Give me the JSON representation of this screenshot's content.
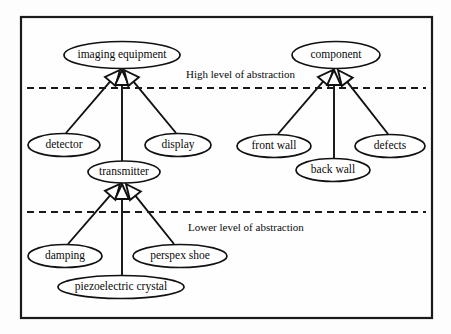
{
  "diagram": {
    "type": "uml-generalization-hierarchy",
    "canvas": {
      "width": 451,
      "height": 334
    },
    "frame": {
      "x": 21,
      "y": 17,
      "width": 411,
      "height": 301,
      "stroke": "#1a1a1a"
    },
    "style": {
      "node_fill": "#ffffff",
      "node_stroke": "#111111",
      "line_color": "#111111",
      "text_color": "#0a0a0a",
      "background": "#fdfdfd"
    },
    "nodes": [
      {
        "id": "imaging-equipment",
        "label": "imaging equipment",
        "cx": 122,
        "cy": 55,
        "rx": 58,
        "ry": 13.5,
        "font_size": 11.5
      },
      {
        "id": "component",
        "label": "component",
        "cx": 336,
        "cy": 55,
        "rx": 44,
        "ry": 13.5,
        "font_size": 11.5
      },
      {
        "id": "detector",
        "label": "detector",
        "cx": 64,
        "cy": 145,
        "rx": 36,
        "ry": 11.5,
        "font_size": 11.5
      },
      {
        "id": "display",
        "label": "display",
        "cx": 178,
        "cy": 145,
        "rx": 33,
        "ry": 11.5,
        "font_size": 11.5
      },
      {
        "id": "transmitter",
        "label": "transmitter",
        "cx": 124,
        "cy": 172,
        "rx": 36,
        "ry": 11,
        "font_size": 11.5
      },
      {
        "id": "front-wall",
        "label": "front wall",
        "cx": 274,
        "cy": 146,
        "rx": 37,
        "ry": 11.5,
        "font_size": 11.5
      },
      {
        "id": "defects",
        "label": "defects",
        "cx": 390,
        "cy": 146,
        "rx": 35,
        "ry": 11.5,
        "font_size": 11.5
      },
      {
        "id": "back-wall",
        "label": "back wall",
        "cx": 333,
        "cy": 170,
        "rx": 37,
        "ry": 11.5,
        "font_size": 11.5
      },
      {
        "id": "damping",
        "label": "damping",
        "cx": 65,
        "cy": 256,
        "rx": 37,
        "ry": 11.5,
        "font_size": 11.5
      },
      {
        "id": "perspex-shoe",
        "label": "perspex shoe",
        "cx": 180,
        "cy": 256,
        "rx": 47,
        "ry": 11.5,
        "font_size": 11.5
      },
      {
        "id": "piezoelectric-crystal",
        "label": "piezoelectric crystal",
        "cx": 121,
        "cy": 287,
        "rx": 63,
        "ry": 11.5,
        "font_size": 11.5
      }
    ],
    "generalizations": [
      {
        "id": "detector-to-imaging-equipment",
        "child": "detector",
        "parent": "imaging-equipment",
        "from": [
          66,
          133
        ],
        "to": [
          120,
          70
        ],
        "arrow_size": 15
      },
      {
        "id": "transmitter-to-imaging-equipment",
        "child": "transmitter",
        "parent": "imaging-equipment",
        "from": [
          122,
          161
        ],
        "to": [
          122,
          70
        ],
        "arrow_size": 15
      },
      {
        "id": "display-to-imaging-equipment",
        "child": "display",
        "parent": "imaging-equipment",
        "from": [
          176,
          133
        ],
        "to": [
          124,
          70
        ],
        "arrow_size": 15
      },
      {
        "id": "front-wall-to-component",
        "child": "front-wall",
        "parent": "component",
        "from": [
          278,
          134
        ],
        "to": [
          333,
          70
        ],
        "arrow_size": 15
      },
      {
        "id": "back-wall-to-component",
        "child": "back-wall",
        "parent": "component",
        "from": [
          334,
          158
        ],
        "to": [
          334,
          70
        ],
        "arrow_size": 15
      },
      {
        "id": "defects-to-component",
        "child": "defects",
        "parent": "component",
        "from": [
          388,
          134
        ],
        "to": [
          338,
          70
        ],
        "arrow_size": 15
      },
      {
        "id": "damping-to-transmitter",
        "child": "damping",
        "parent": "transmitter",
        "from": [
          68,
          244
        ],
        "to": [
          120,
          184
        ],
        "arrow_size": 15
      },
      {
        "id": "piezoelectric-crystal-to-transmitter",
        "child": "piezoelectric-crystal",
        "parent": "transmitter",
        "from": [
          122,
          276
        ],
        "to": [
          122,
          184
        ],
        "arrow_size": 15
      },
      {
        "id": "perspex-shoe-to-transmitter",
        "child": "perspex-shoe",
        "parent": "transmitter",
        "from": [
          174,
          244
        ],
        "to": [
          126,
          184
        ],
        "arrow_size": 15
      }
    ],
    "dividers": [
      {
        "id": "high-level-divider",
        "label": "High level of abstraction",
        "y": 88,
        "x1": 27,
        "x2": 426,
        "label_x": 186,
        "label_y": 75,
        "font_size": 11
      },
      {
        "id": "lower-level-divider",
        "label": "Lower level of abstraction",
        "y": 212,
        "x1": 27,
        "x2": 426,
        "label_x": 188,
        "label_y": 228,
        "font_size": 11
      }
    ]
  }
}
